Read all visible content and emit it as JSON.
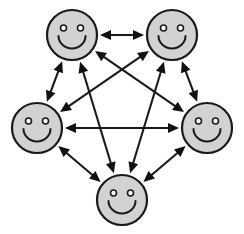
{
  "diagram": {
    "type": "complete-graph",
    "node_count": 5,
    "edge_count": 10,
    "background_color": "#ffffff",
    "node_fill_color": "#d2d2d2",
    "node_stroke_color": "#1a1a1a",
    "edge_color": "#1a1a1a",
    "canvas": {
      "width": 244,
      "height": 234
    },
    "nodes": [
      {
        "id": "top-left",
        "label": "",
        "cx": 72,
        "cy": 35,
        "r": 25,
        "expression": "smiley-face"
      },
      {
        "id": "top-right",
        "label": "",
        "cx": 172,
        "cy": 35,
        "r": 25,
        "expression": "smiley-face"
      },
      {
        "id": "left",
        "label": "",
        "cx": 37,
        "cy": 128,
        "r": 25,
        "expression": "smiley-face"
      },
      {
        "id": "right",
        "label": "",
        "cx": 207,
        "cy": 128,
        "r": 25,
        "expression": "smiley-face"
      },
      {
        "id": "bottom",
        "label": "",
        "cx": 122,
        "cy": 200,
        "r": 25,
        "expression": "smiley-face"
      }
    ],
    "edges": [
      {
        "from": "top-left",
        "to": "top-right",
        "kind": "perimeter",
        "direction": "bidirectional"
      },
      {
        "from": "top-left",
        "to": "left",
        "kind": "perimeter",
        "direction": "bidirectional"
      },
      {
        "from": "top-right",
        "to": "right",
        "kind": "perimeter",
        "direction": "bidirectional"
      },
      {
        "from": "left",
        "to": "bottom",
        "kind": "perimeter",
        "direction": "bidirectional"
      },
      {
        "from": "right",
        "to": "bottom",
        "kind": "perimeter",
        "direction": "bidirectional"
      },
      {
        "from": "top-left",
        "to": "right",
        "kind": "diagonal",
        "direction": "bidirectional"
      },
      {
        "from": "top-left",
        "to": "bottom",
        "kind": "diagonal",
        "direction": "bidirectional"
      },
      {
        "from": "top-right",
        "to": "left",
        "kind": "diagonal",
        "direction": "bidirectional"
      },
      {
        "from": "top-right",
        "to": "bottom",
        "kind": "diagonal",
        "direction": "bidirectional"
      },
      {
        "from": "left",
        "to": "right",
        "kind": "diagonal",
        "direction": "bidirectional"
      }
    ],
    "face_style": {
      "eye_offset_x": 8.5,
      "eye_offset_y": -7.0,
      "eye_radius": 3.0,
      "smile_radius": 13.5,
      "smile_center_y_offset": 1.0
    },
    "arrow": {
      "head_length": 11,
      "head_half_width": 5,
      "gap_from_node": 3,
      "shaft_width": 2.1
    }
  }
}
